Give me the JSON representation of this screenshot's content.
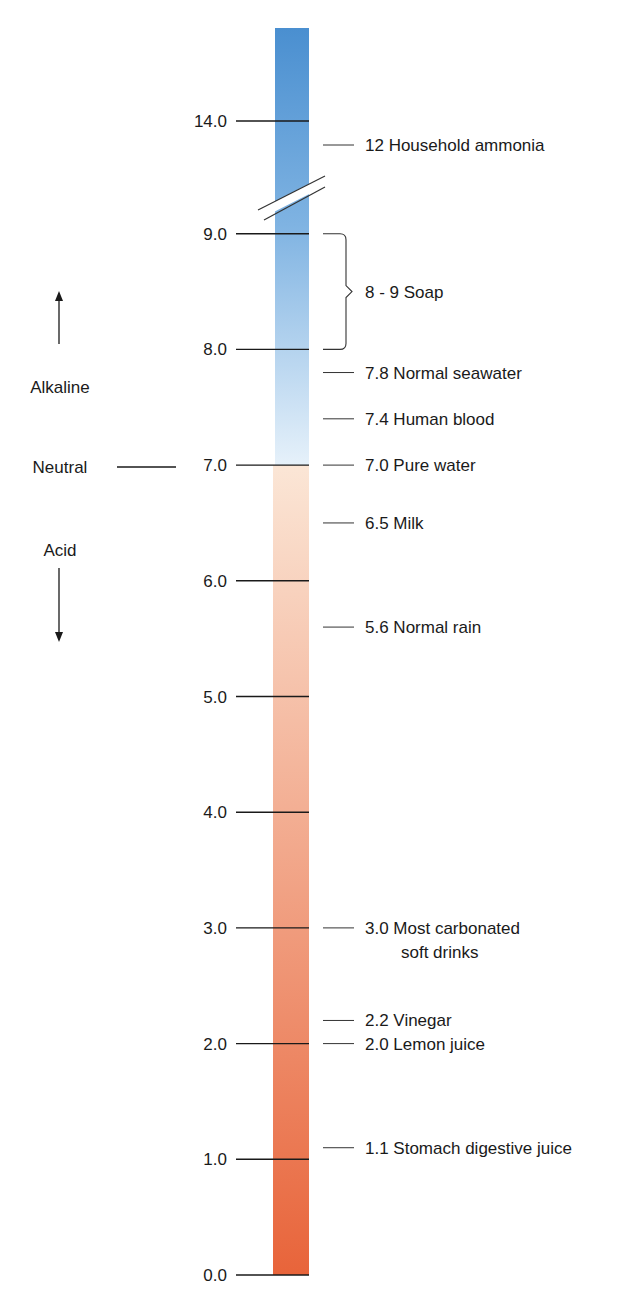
{
  "chart_data": {
    "type": "scale",
    "axis": {
      "ticks": [
        0.0,
        1.0,
        2.0,
        3.0,
        4.0,
        5.0,
        6.0,
        7.0,
        8.0,
        9.0,
        14.0
      ],
      "tick_labels": [
        "0.0",
        "1.0",
        "2.0",
        "3.0",
        "4.0",
        "5.0",
        "6.0",
        "7.0",
        "8.0",
        "9.0",
        "14.0"
      ],
      "break_between": [
        9.0,
        14.0
      ]
    },
    "gradient": {
      "acid_bottom_color": "#e8643a",
      "neutral_acid_color": "#fbe6d6",
      "neutral_alkaline_color": "#e6f1fa",
      "alkaline_top_color": "#4a8fd0"
    },
    "side_labels": {
      "alkaline": "Alkaline",
      "neutral": "Neutral",
      "acid": "Acid"
    },
    "annotations": [
      {
        "value": 12,
        "display_value": 12,
        "label": "12 Household ammonia"
      },
      {
        "range": [
          8,
          9
        ],
        "label": "8 - 9 Soap"
      },
      {
        "value": 7.8,
        "label": "7.8 Normal seawater"
      },
      {
        "value": 7.4,
        "label": "7.4 Human blood"
      },
      {
        "value": 7.0,
        "label": "7.0 Pure water"
      },
      {
        "value": 6.5,
        "label": "6.5 Milk"
      },
      {
        "value": 5.6,
        "label": "5.6 Normal rain"
      },
      {
        "value": 3.0,
        "label": "3.0 Most carbonated",
        "label_line2": "soft drinks"
      },
      {
        "value": 2.2,
        "label": "2.2 Vinegar"
      },
      {
        "value": 2.0,
        "label": "2.0 Lemon juice"
      },
      {
        "value": 1.1,
        "label": "1.1 Stomach digestive juice"
      }
    ]
  }
}
